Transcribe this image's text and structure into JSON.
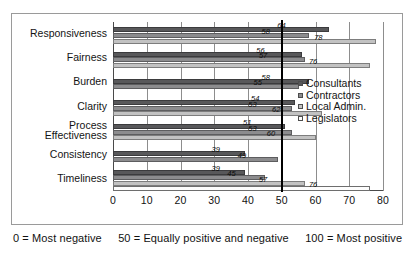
{
  "chart_data": {
    "type": "bar",
    "orientation": "horizontal",
    "title": "",
    "xlabel": "",
    "ylabel": "",
    "xlim": [
      0,
      80
    ],
    "xticks": [
      0,
      10,
      20,
      30,
      40,
      50,
      60,
      70,
      80
    ],
    "grid": true,
    "legend_position": "right",
    "reference_line": 50,
    "categories": [
      "Responsiveness",
      "Fairness",
      "Burden",
      "Clarity",
      "Process Effectiveness",
      "Consistency",
      "Timeliness"
    ],
    "series": [
      {
        "name": "Consultants",
        "color": "#58585a",
        "values": [
          64,
          56,
          58,
          54,
          51,
          39,
          39
        ]
      },
      {
        "name": "Contractors",
        "color": "#8c8c8e",
        "values": [
          58,
          57,
          55,
          53,
          53,
          49,
          45
        ]
      },
      {
        "name": "Local Admin.",
        "color": "#c2c2c2",
        "values": [
          78,
          76,
          null,
          62,
          60,
          null,
          57
        ]
      },
      {
        "name": "Legislators",
        "color": "#fdfdfd",
        "values": [
          null,
          null,
          null,
          null,
          null,
          null,
          76
        ]
      }
    ]
  },
  "legend": {
    "items": [
      {
        "label": "Consultants"
      },
      {
        "label": "Contractors"
      },
      {
        "label": "Local Admin."
      },
      {
        "label": "Legislators"
      }
    ]
  },
  "caption": {
    "part1": "0 = Most negative",
    "part2": "50 = Equally positive and negative",
    "part3": "100 = Most positive"
  }
}
